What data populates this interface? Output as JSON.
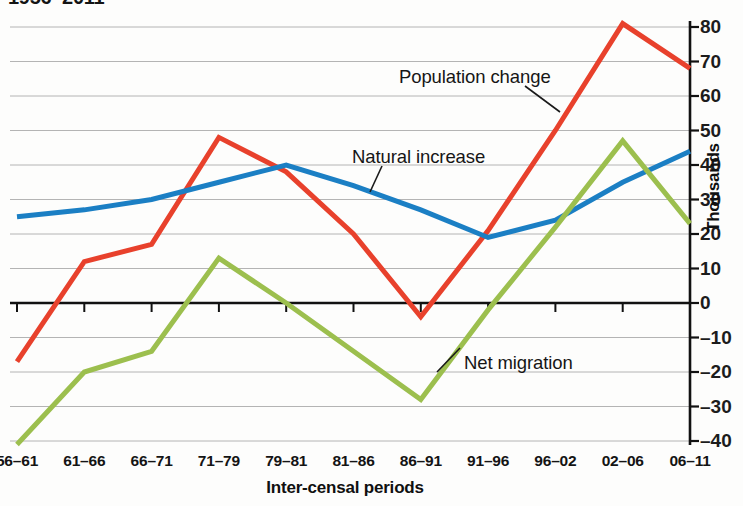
{
  "chart_data": {
    "type": "line",
    "title": "1956–2011",
    "xlabel": "Inter-censal periods",
    "ylabel": "Thousands",
    "categories": [
      "56–61",
      "61–66",
      "66–71",
      "71–79",
      "79–81",
      "81–86",
      "86–91",
      "91–96",
      "96–02",
      "02–06",
      "06–11"
    ],
    "ylim": [
      -40,
      80
    ],
    "ytick_labels": [
      "80",
      "70",
      "60",
      "50",
      "40",
      "30",
      "20",
      "10",
      "0",
      "–10",
      "–20",
      "–30",
      "–40"
    ],
    "ytick_values": [
      80,
      70,
      60,
      50,
      40,
      30,
      20,
      10,
      0,
      -10,
      -20,
      -30,
      -40
    ],
    "grid": true,
    "legend_position": "inline-annotations",
    "series": [
      {
        "name": "Population change",
        "color": "#e8412c",
        "values": [
          -17,
          12,
          17,
          48,
          38,
          20,
          -4,
          21,
          50,
          81,
          68
        ]
      },
      {
        "name": "Natural increase",
        "color": "#1b7fc4",
        "values": [
          25,
          27,
          30,
          35,
          40,
          34,
          27,
          19,
          24,
          35,
          44
        ]
      },
      {
        "name": "Net migration",
        "color": "#9cbf4e",
        "values": [
          -41,
          -20,
          -14,
          13,
          0,
          -14,
          -28,
          -2,
          22,
          47,
          23
        ]
      }
    ],
    "annotations": [
      {
        "text": "Population change",
        "x": 399,
        "y": 66,
        "leader": {
          "x1": 525,
          "y1": 86,
          "x2": 560,
          "y2": 112
        }
      },
      {
        "text": "Natural increase",
        "x": 352,
        "y": 146,
        "leader": {
          "x1": 382,
          "y1": 166,
          "x2": 370,
          "y2": 192
        }
      },
      {
        "text": "Net migration",
        "x": 464,
        "y": 352,
        "leader": {
          "x1": 460,
          "y1": 348,
          "x2": 437,
          "y2": 372
        }
      }
    ]
  }
}
